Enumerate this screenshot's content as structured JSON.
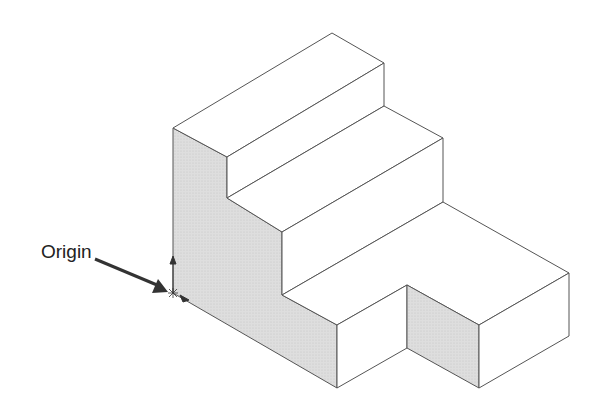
{
  "diagram": {
    "origin_label": "Origin",
    "colors": {
      "edge": "#555555",
      "shaded_face": "#d9d9d9",
      "light_face": "#ffffff",
      "arrow": "#333333"
    }
  }
}
